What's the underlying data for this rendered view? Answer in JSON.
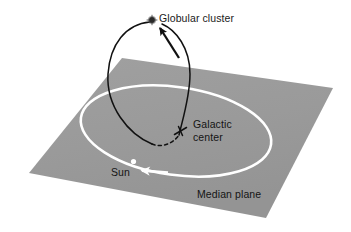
{
  "figure": {
    "title_text": "",
    "type": "astronomy-schematic",
    "background_color": "#ffffff"
  },
  "labels": {
    "globular_cluster": "Globular cluster",
    "galactic_center_line1": "Galactic",
    "galactic_center_line2": "center",
    "sun": "Sun",
    "median_plane": "Median plane"
  },
  "colors": {
    "plane_fill": "#999999",
    "plane_fill_light": "#a3a3a3",
    "orbit_circle": "#ffffff",
    "trajectory": "#111111",
    "text": "#1a1a1a",
    "cluster_marker": "#1a1a1a",
    "sun_marker": "#ffffff",
    "background": "#ffffff"
  },
  "geometry": {
    "plane_corners": "122,58 333,88 266,218 29,173",
    "orbit_center_x": 176,
    "orbit_center_y": 131,
    "orbit_radius_x": 96,
    "orbit_radius_y": 44,
    "orbit_rotation_deg": 8,
    "galactic_center_x": 181,
    "galactic_center_y": 131,
    "cluster_x": 152,
    "cluster_y": 20,
    "sun_x": 134,
    "sun_y": 162
  },
  "markers": {
    "galactic_center_symbol": "cross-x",
    "cluster_symbol": "filled-star-dot",
    "sun_symbol": "white-dot",
    "orbit_direction_arrow": "leftward-along-orbit",
    "trajectory_arrow": "toward-globular-cluster"
  },
  "elements": {
    "plane_name": "median-plane",
    "orbit_name": "sun-orbit-circle",
    "trajectory_name": "globular-cluster-orbit-path",
    "dashed_segment_note": "hidden-behind-plane"
  }
}
